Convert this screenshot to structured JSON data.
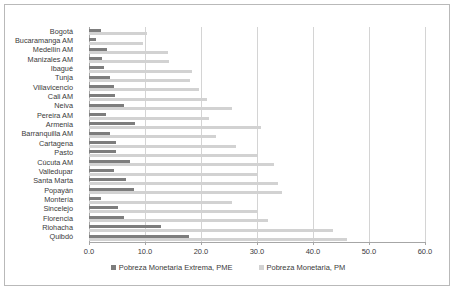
{
  "chart_data": {
    "type": "bar",
    "orientation": "horizontal",
    "title": "",
    "xlabel": "",
    "ylabel": "",
    "xlim": [
      0.0,
      60.0
    ],
    "xticks": [
      "0.0",
      "10.0",
      "20.0",
      "30.0",
      "40.0",
      "50.0",
      "60.0"
    ],
    "xtick_values": [
      0,
      10,
      20,
      30,
      40,
      50,
      60
    ],
    "grid": true,
    "legend_position": "bottom",
    "categories": [
      "Bogotá",
      "Bucaramanga AM",
      "Medellín AM",
      "Manizales AM",
      "Ibagué",
      "Tunja",
      "Villavicencio",
      "Cali AM",
      "Neiva",
      "Pereira AM",
      "Armenia",
      "Barranquilla AM",
      "Cartagena",
      "Pasto",
      "Cúcuta AM",
      "Valledupar",
      "Santa Marta",
      "Popayán",
      "Montería",
      "Sincelejo",
      "Florencia",
      "Riohacha",
      "Quibdó"
    ],
    "series": [
      {
        "name": "Pobreza Monetaria Extrema, PME",
        "color": "#7d7d7d",
        "values": [
          2.1,
          1.2,
          3.3,
          2.4,
          2.7,
          3.7,
          4.4,
          4.6,
          6.2,
          3.1,
          8.2,
          3.8,
          4.8,
          4.8,
          7.3,
          4.5,
          6.6,
          8.0,
          2.2,
          5.1,
          6.3,
          12.9,
          17.8
        ]
      },
      {
        "name": "Pobreza Monetaria, PM",
        "color": "#d2d2d2",
        "values": [
          10.4,
          9.6,
          14.1,
          14.3,
          18.4,
          18.0,
          19.6,
          21.0,
          25.6,
          21.5,
          30.8,
          22.6,
          26.2,
          30.2,
          33.0,
          30.0,
          33.7,
          34.5,
          25.5,
          30.0,
          32.0,
          43.5,
          46.0
        ]
      }
    ]
  },
  "legend": {
    "items": [
      {
        "label": "Pobreza Monetaria Extrema, PME",
        "key": "pme"
      },
      {
        "label": "Pobreza Monetaria, PM",
        "key": "pm"
      }
    ]
  }
}
